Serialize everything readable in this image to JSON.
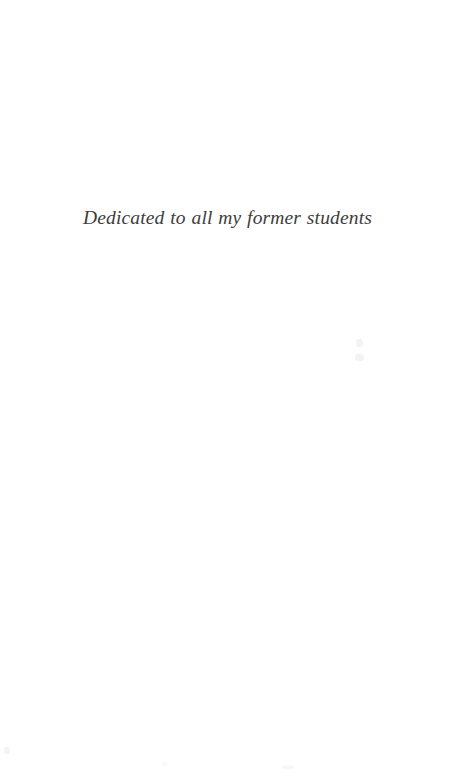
{
  "page": {
    "background_color": "#ffffff",
    "width": 455,
    "height": 770,
    "kind": "book-dedication-page"
  },
  "dedication": {
    "text": "Dedicated to all my former students",
    "text_color": "#33312f",
    "style": "italic",
    "alignment": "center"
  },
  "artifacts": {
    "speck_color": "#f2f1f0",
    "description": "faint scan specks"
  }
}
